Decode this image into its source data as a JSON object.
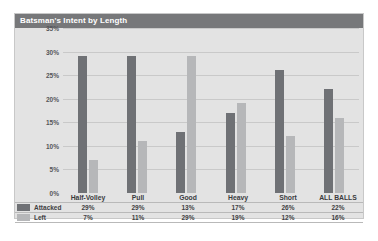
{
  "chart_data": {
    "type": "bar",
    "title": "Batsman's Intent by Length",
    "xlabel": "",
    "ylabel": "",
    "ylim": [
      0,
      35
    ],
    "yticks": [
      "0%",
      "5%",
      "10%",
      "15%",
      "20%",
      "25%",
      "30%",
      "35%"
    ],
    "grid": true,
    "legend_position": "table-left",
    "categories": [
      "Half-Volley",
      "Pull",
      "Good",
      "Heavy",
      "Short",
      "ALL BALLS"
    ],
    "series": [
      {
        "name": "Attacked",
        "color": "#6f7175",
        "values": [
          29,
          29,
          13,
          17,
          26,
          22
        ],
        "labels": [
          "29%",
          "29%",
          "13%",
          "17%",
          "26%",
          "22%"
        ]
      },
      {
        "name": "Left",
        "color": "#b6b7b9",
        "values": [
          7,
          11,
          29,
          19,
          12,
          16
        ],
        "labels": [
          "7%",
          "11%",
          "29%",
          "19%",
          "12%",
          "16%"
        ]
      }
    ]
  },
  "panel": {
    "title": "Batsman's Intent by Length"
  }
}
